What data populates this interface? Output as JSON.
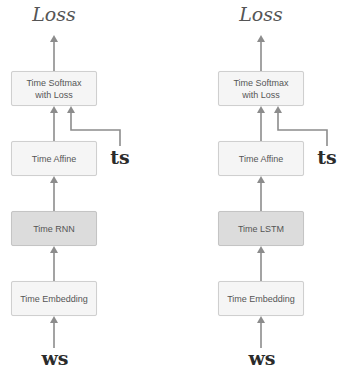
{
  "diagrams": [
    {
      "id": "rnnlm",
      "output_label": "Loss",
      "target_label": "ts",
      "input_label": "ws",
      "layers": [
        {
          "label": "Time Softmax\nwith Loss",
          "style": "light"
        },
        {
          "label": "Time Affine",
          "style": "light"
        },
        {
          "label": "Time RNN",
          "style": "dark"
        },
        {
          "label": "Time Embedding",
          "style": "light"
        }
      ]
    },
    {
      "id": "lstm-lm",
      "output_label": "Loss",
      "target_label": "ts",
      "input_label": "ws",
      "layers": [
        {
          "label": "Time Softmax\nwith Loss",
          "style": "light"
        },
        {
          "label": "Time Affine",
          "style": "light"
        },
        {
          "label": "Time LSTM",
          "style": "dark"
        },
        {
          "label": "Time Embedding",
          "style": "light"
        }
      ]
    }
  ],
  "colors": {
    "arrow": "#8c8c8c",
    "box_light": "#f5f5f5",
    "box_dark": "#dcdcdc",
    "box_border": "#cfcfcf",
    "text": "#555555"
  }
}
